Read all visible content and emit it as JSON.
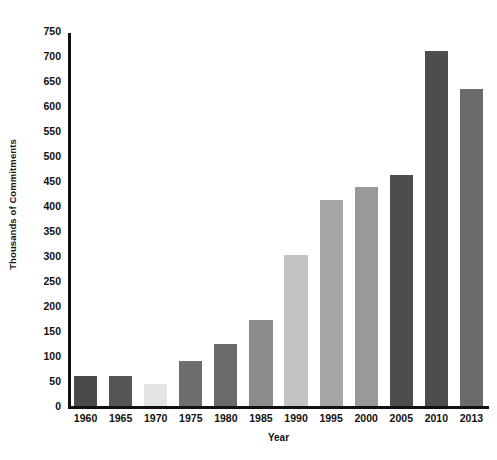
{
  "chart_data": {
    "type": "bar",
    "title": "",
    "xlabel": "Year",
    "ylabel": "Thousands of Commitments",
    "categories": [
      "1960",
      "1965",
      "1970",
      "1975",
      "1980",
      "1985",
      "1990",
      "1995",
      "2000",
      "2005",
      "2010",
      "2013"
    ],
    "values": [
      60,
      60,
      45,
      90,
      125,
      173,
      303,
      412,
      438,
      463,
      710,
      635
    ],
    "bar_colors": [
      "#4a4a4a",
      "#555555",
      "#e3e3e3",
      "#6e6e6e",
      "#6a6a6a",
      "#8c8c8c",
      "#c2c2c2",
      "#a6a6a6",
      "#999999",
      "#4d4d4d",
      "#4d4d4d",
      "#6b6b6b"
    ],
    "ylim": [
      0,
      750
    ],
    "yticks": [
      0,
      50,
      100,
      150,
      200,
      250,
      300,
      350,
      400,
      450,
      500,
      550,
      600,
      650,
      700,
      750
    ],
    "ytick_labels": [
      "0",
      "50",
      "100",
      "150",
      "200",
      "250",
      "300",
      "350",
      "400",
      "450",
      "500",
      "550",
      "600",
      "650",
      "700",
      "750"
    ],
    "grid": false,
    "legend": null,
    "axis_color": "#111111",
    "background": "#ffffff"
  }
}
